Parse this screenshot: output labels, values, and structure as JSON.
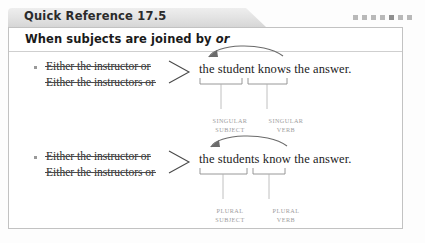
{
  "tab": {
    "title": "Quick Reference 17.5",
    "decor_squares": 7,
    "decor_color": "#b9b9b9"
  },
  "box": {
    "heading_prefix": "When subjects are joined by ",
    "heading_emphasis": "or"
  },
  "examples": [
    {
      "bullet_icon": "square-bullet-icon",
      "alternatives": [
        "Either the instructor or",
        "Either the instructors or"
      ],
      "brace_icon": "angle-brace-icon",
      "sentence": {
        "lead": "the ",
        "subject": "student",
        "mid": " ",
        "verb": "knows",
        "tail": " the answer."
      },
      "arrow_icon": "curved-arrow-left-icon",
      "labels": {
        "subject": "SINGULAR\nSUBJECT",
        "subject_line1": "SINGULAR",
        "subject_line2": "SUBJECT",
        "verb_line1": "SINGULAR",
        "verb_line2": "VERB"
      }
    },
    {
      "bullet_icon": "square-bullet-icon",
      "alternatives": [
        "Either the instructor or",
        "Either the instructors or"
      ],
      "brace_icon": "angle-brace-icon",
      "sentence": {
        "lead": "the ",
        "subject": "students",
        "mid": " ",
        "verb": "know",
        "tail": " the answer."
      },
      "arrow_icon": "curved-arrow-left-icon",
      "labels": {
        "subject_line1": "PLURAL",
        "subject_line2": "SUBJECT",
        "verb_line1": "PLURAL",
        "verb_line2": "VERB"
      }
    }
  ],
  "colors": {
    "label_gray": "#9d9d9d",
    "border_gray": "#c2c2c2",
    "tab_gray": "#e3e3e3",
    "text_dark": "#1c1c1c"
  }
}
